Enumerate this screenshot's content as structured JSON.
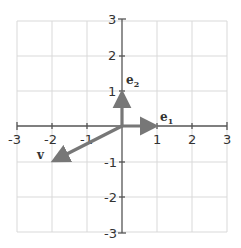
{
  "diagram": {
    "type": "vector-plot",
    "x_range": [
      -3,
      3
    ],
    "y_range": [
      -3,
      3
    ],
    "grid": true,
    "x_ticks": [
      "-3",
      "-2",
      "-1",
      "1",
      "2",
      "3"
    ],
    "y_ticks": [
      "3",
      "2",
      "1",
      "-1",
      "-2",
      "-3"
    ],
    "vectors": [
      {
        "name": "e",
        "subscript": "1",
        "from": [
          0,
          0
        ],
        "to": [
          1,
          0
        ]
      },
      {
        "name": "e",
        "subscript": "2",
        "from": [
          0,
          0
        ],
        "to": [
          0,
          1
        ]
      },
      {
        "name": "v",
        "subscript": "",
        "from": [
          0,
          0
        ],
        "to": [
          -2,
          -1
        ]
      }
    ],
    "colors": {
      "grid": "#d9d9d9",
      "axis": "#555555",
      "vector": "#777777"
    }
  },
  "labels": {
    "e1_main": "e",
    "e1_sub": "1",
    "e2_main": "e",
    "e2_sub": "2",
    "v": "v"
  },
  "ticks": {
    "xm3": "-3",
    "xm2": "-2",
    "xm1": "-1",
    "x1": "1",
    "x2": "2",
    "x3": "3",
    "y3": "3",
    "y2": "2",
    "y1": "1",
    "ym1": "-1",
    "ym2": "-2",
    "ym3": "-3"
  }
}
